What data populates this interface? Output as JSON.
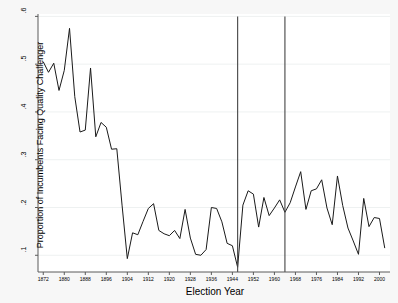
{
  "chart_data": {
    "type": "line",
    "title": "",
    "xlabel": "Election Year",
    "ylabel": "Proportion of Incumbents Facing Quality Challenger",
    "xlim": [
      1870,
      2004
    ],
    "ylim": [
      0.065,
      0.605
    ],
    "grid": "horizontal",
    "legend": "none",
    "xticks": [
      1872,
      1880,
      1888,
      1896,
      1904,
      1912,
      1920,
      1928,
      1936,
      1944,
      1952,
      1960,
      1968,
      1976,
      1984,
      1992,
      2000
    ],
    "xtick_labels": [
      "1872",
      "1880",
      "1888",
      "1896",
      "1904",
      "1912",
      "1920",
      "1928",
      "1936",
      "1944",
      "1952",
      "1960",
      "1968",
      "1976",
      "1984",
      "1992",
      "2000"
    ],
    "yticks": [
      0.1,
      0.2,
      0.3,
      0.4,
      0.5,
      0.6
    ],
    "ytick_labels": [
      ".1",
      ".2",
      ".3",
      ".4",
      ".5",
      ".6"
    ],
    "line_color": "#1a1a1a",
    "reference_lines": [
      {
        "x": 1946,
        "label": "",
        "color": "#444444"
      },
      {
        "x": 1964,
        "label": "",
        "color": "#444444"
      }
    ],
    "x": [
      1872,
      1874,
      1876,
      1878,
      1880,
      1882,
      1884,
      1886,
      1888,
      1890,
      1892,
      1894,
      1896,
      1898,
      1900,
      1902,
      1904,
      1906,
      1908,
      1910,
      1912,
      1914,
      1916,
      1918,
      1920,
      1922,
      1924,
      1926,
      1928,
      1930,
      1932,
      1934,
      1936,
      1938,
      1940,
      1942,
      1944,
      1946,
      1948,
      1950,
      1952,
      1954,
      1956,
      1958,
      1960,
      1962,
      1964,
      1966,
      1968,
      1970,
      1972,
      1974,
      1976,
      1978,
      1980,
      1982,
      1984,
      1986,
      1988,
      1990,
      1992,
      1994,
      1996,
      1998,
      2000,
      2002
    ],
    "values": [
      0.505,
      0.483,
      0.502,
      0.445,
      0.487,
      0.575,
      0.432,
      0.358,
      0.362,
      0.492,
      0.348,
      0.378,
      0.368,
      0.322,
      0.323,
      0.205,
      0.093,
      0.147,
      0.143,
      0.171,
      0.198,
      0.208,
      0.152,
      0.145,
      0.141,
      0.152,
      0.135,
      0.196,
      0.136,
      0.102,
      0.1,
      0.112,
      0.2,
      0.198,
      0.17,
      0.125,
      0.12,
      0.075,
      0.205,
      0.235,
      0.228,
      0.159,
      0.221,
      0.183,
      0.199,
      0.216,
      0.19,
      0.21,
      0.243,
      0.275,
      0.196,
      0.235,
      0.239,
      0.258,
      0.199,
      0.164,
      0.266,
      0.204,
      0.157,
      0.13,
      0.102,
      0.219,
      0.16,
      0.179,
      0.177,
      0.115
    ]
  },
  "axis": {
    "x_title": "Election Year",
    "y_title": "Proportion of Incumbents Facing Quality Challenger"
  }
}
